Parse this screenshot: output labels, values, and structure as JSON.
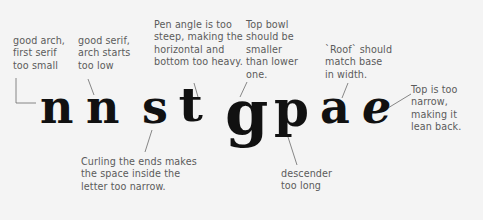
{
  "letters": [
    "n",
    "n",
    "s",
    "t",
    "g",
    "p",
    "a",
    "e"
  ],
  "annotations": {
    "n1": "good arch,\nfirst serif\ntoo small",
    "n2": "good serif,\narch starts\ntoo low",
    "s": "Curling the ends makes\nthe space inside the\nletter too narrow.",
    "t": "Pen angle is too\nsteep, making the\nhorizontal and\nbottom too heavy.",
    "g": "Top bowl\nshould be\nsmaller\nthan lower\none.",
    "p": "descender\ntoo long",
    "a": "`Roof` should\nmatch base\nin width.",
    "e": "Top is too\nnarrow,\nmaking it\nlean back."
  },
  "colors": {
    "background": "#f4f4f4",
    "text": "#5b5b5b",
    "ink": "#111111",
    "leader": "#6a6a6a"
  }
}
